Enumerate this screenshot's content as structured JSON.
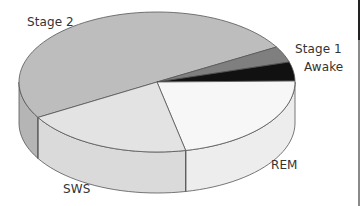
{
  "chart_data": {
    "type": "pie",
    "style": "3d",
    "title": "",
    "categories": [
      "Stage 2",
      "Stage 1",
      "Awake",
      "REM",
      "SWS"
    ],
    "values": [
      50,
      4,
      4,
      22,
      20
    ],
    "unit": "% of sleep (approx.)",
    "colors": {
      "Stage 2": "#bdbdbd",
      "Stage 1": "#7f7f7f",
      "Awake": "#111111",
      "REM": "#f7f7f7",
      "SWS": "#e3e3e3"
    },
    "legend": "none (direct labels)"
  },
  "labels": {
    "stage2": "Stage 2",
    "stage1": "Stage 1",
    "awake": "Awake",
    "rem": "REM",
    "sws": "SWS"
  },
  "geometry": {
    "cx": 157,
    "cy": 82,
    "rx": 138,
    "ry": 70,
    "depth": 41,
    "angles_deg": {
      "Stage 2": [
        149.6,
        330
      ],
      "Stage 1": [
        330,
        343.4
      ],
      "Awake": [
        343.4,
        359.2
      ],
      "REM": [
        -0.8,
        78
      ],
      "SWS": [
        78,
        149.6
      ]
    }
  }
}
